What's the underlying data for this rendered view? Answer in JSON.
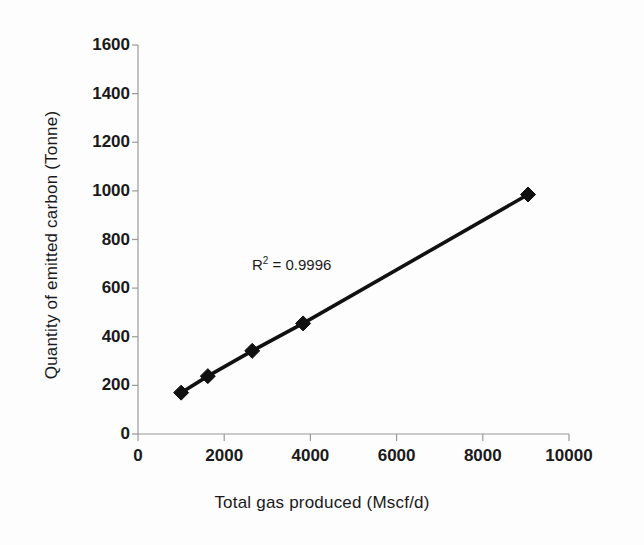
{
  "chart_data": {
    "type": "scatter",
    "title": "",
    "xlabel": "Total gas produced (Mscf/d)",
    "ylabel": "Quantity of emitted carbon (Tonne)",
    "xlim": [
      0,
      10000
    ],
    "ylim": [
      0,
      1600
    ],
    "xticks": [
      0,
      2000,
      4000,
      6000,
      8000,
      10000
    ],
    "yticks": [
      0,
      200,
      400,
      600,
      800,
      1000,
      1200,
      1400,
      1600
    ],
    "xtick_labels": [
      "0",
      "2000",
      "4000",
      "6000",
      "8000",
      "10000"
    ],
    "ytick_labels": [
      "0",
      "200",
      "400",
      "600",
      "800",
      "1000",
      "1200",
      "1400",
      "1600"
    ],
    "grid": false,
    "legend": false,
    "marker": "diamond",
    "marker_color": "#111111",
    "line_color": "#111111",
    "series": [
      {
        "name": "Emitted carbon vs gas produced",
        "x": [
          1000,
          1620,
          2650,
          3830,
          9050
        ],
        "y": [
          170,
          238,
          342,
          455,
          985
        ]
      }
    ],
    "annotations": [
      {
        "name": "r-squared",
        "text_prefix": "R",
        "text_sup": "2",
        "text_suffix": " = 0.9996",
        "value": 0.9996,
        "x": 3800,
        "y": 660
      }
    ]
  },
  "axes": {
    "x_title": "Total gas produced (Mscf/d)",
    "y_title": "Quantity of emitted carbon (Tonne)"
  },
  "annotation": {
    "r2_prefix": "R",
    "r2_sup": "2",
    "r2_suffix": " = 0.9996"
  },
  "colors": {
    "background": "#fdfdfd",
    "axis": "#9a9a9a",
    "text": "#1a1a1a",
    "series": "#111111"
  }
}
